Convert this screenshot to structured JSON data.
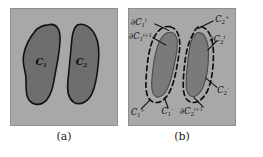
{
  "figure": {
    "panel_a": {
      "caption": "(a)",
      "background_color": "#a8a8a8",
      "region_fill_color": "#6e6e6e",
      "outline_color": "#111111",
      "regions": [
        {
          "name": "region-c1",
          "label": "C",
          "sub": "1",
          "sup": ""
        },
        {
          "name": "region-c2",
          "label": "C",
          "sub": "2",
          "sup": ""
        }
      ]
    },
    "panel_b": {
      "caption": "(b)",
      "background_color": "#a8a8a8",
      "region_fill_color": "#7a7a7a",
      "dashed_curve_color": "#0f0f0f",
      "annotations": [
        {
          "name": "label-dc1-i",
          "text": "∂C",
          "sub": "1",
          "sup": "i"
        },
        {
          "name": "label-dc1-i-plus",
          "text": "∂C",
          "sub": "1",
          "sup": "i+1"
        },
        {
          "name": "label-c2-plus",
          "text": "C",
          "sub": "2",
          "sup": "+"
        },
        {
          "name": "label-dc2-i",
          "text": "∂C",
          "sub": "2",
          "sup": "i"
        },
        {
          "name": "label-c2-minus",
          "text": "C",
          "sub": "2",
          "sup": "-"
        },
        {
          "name": "label-c1-plus",
          "text": "C",
          "sub": "1",
          "sup": "+"
        },
        {
          "name": "label-c1-minus",
          "text": "C",
          "sub": "1",
          "sup": "-"
        },
        {
          "name": "label-dc2-i-plus",
          "text": "∂C",
          "sub": "2",
          "sup": "i+1"
        }
      ]
    }
  }
}
